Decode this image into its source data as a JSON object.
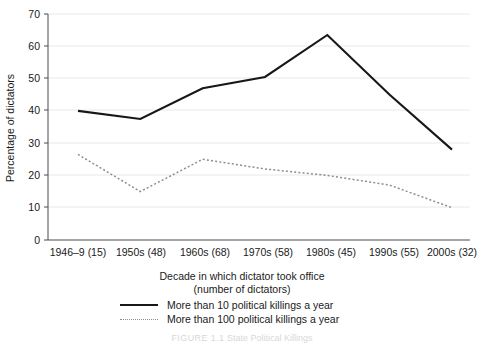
{
  "chart_data": {
    "type": "line",
    "title": "",
    "xlabel": "Decade in which dictator took office (number of dictators)",
    "ylabel": "Percentage of dictators",
    "categories": [
      "1946–9 (15)",
      "1950s (48)",
      "1960s (68)",
      "1970s (58)",
      "1980s (45)",
      "1990s (55)",
      "2000s (32)"
    ],
    "ylim": [
      0,
      70
    ],
    "yticks": [
      0,
      10,
      20,
      30,
      40,
      50,
      60,
      70
    ],
    "grid": true,
    "legend_position": "below",
    "series": [
      {
        "name": "More than 10 political killings a year",
        "style": "solid",
        "color": "#17171a",
        "values": [
          40,
          37.5,
          47,
          50.5,
          63.5,
          45,
          28
        ]
      },
      {
        "name": "More than 100 political killings a year",
        "style": "dotted",
        "color": "#8d8d92",
        "values": [
          26.5,
          15,
          25,
          22,
          20,
          17,
          10
        ]
      }
    ]
  },
  "axis": {
    "ylabel": "Percentage of dictators",
    "xlabel_line1": "Decade in which dictator took office",
    "xlabel_line2": "(number of dictators)",
    "ytick_labels": [
      "0",
      "10",
      "20",
      "30",
      "40",
      "50",
      "60",
      "70"
    ],
    "xtick_labels": [
      "1946–9 (15)",
      "1950s (48)",
      "1960s (68)",
      "1970s (58)",
      "1980s (45)",
      "1990s (55)",
      "2000s (32)"
    ]
  },
  "legend": {
    "items": [
      {
        "label": "More than 10 political killings a year",
        "style": "solid"
      },
      {
        "label": "More than 100 political killings a year",
        "style": "dotted"
      }
    ]
  },
  "caption": {
    "tag": "FIGURE 1.1",
    "text": "State Political Killings"
  }
}
